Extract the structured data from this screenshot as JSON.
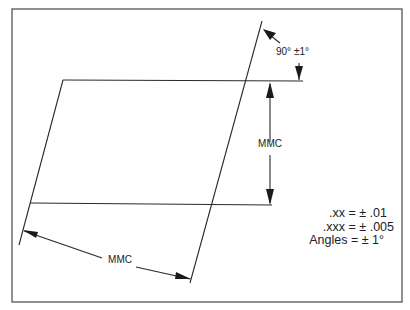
{
  "diagram": {
    "angle_callout": "90° ±1°",
    "vertical_dimension_label": "MMC",
    "slanted_dimension_label": "MMC",
    "tolerance_notes": [
      ".xx = ± .01",
      ".xxx = ± .005",
      "Angles = ± 1°"
    ],
    "colors": {
      "line": "#2a2a2a",
      "frame": "#555555",
      "background": "#ffffff"
    }
  }
}
